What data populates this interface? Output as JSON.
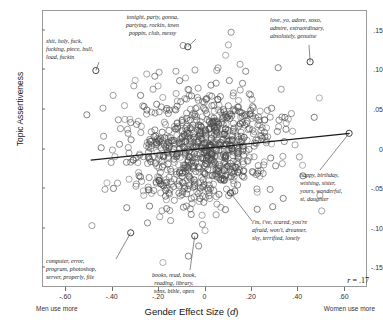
{
  "chart_data": {
    "type": "scatter",
    "title": "",
    "xlabel": "Gender Effect Size (d)",
    "ylabel": "Topic Assertiveness",
    "xlim": [
      -0.7,
      0.7
    ],
    "ylim": [
      -0.175,
      0.175
    ],
    "xticks": [
      -0.6,
      -0.4,
      -0.2,
      0,
      0.2,
      0.4,
      0.6
    ],
    "xticklabels": [
      "-.60",
      "-.40",
      "-.20",
      "0",
      ".20",
      ".40",
      ".60"
    ],
    "yticks": [
      0.15,
      0.1,
      0.05,
      0,
      -0.05,
      -0.1,
      -0.15
    ],
    "yticklabels": [
      ".15",
      ".10",
      ".05",
      "0",
      "-.05",
      "-.10",
      "-.15"
    ],
    "grid": false,
    "legend": null,
    "axis_end_labels": {
      "left": "Men use more",
      "right": "Women use more"
    },
    "correlation_label": "r = .17",
    "correlation": 0.17,
    "marker": {
      "shape": "open-circle",
      "size": 3.1,
      "stroke": "#4a4a4a",
      "fill": "none"
    },
    "n_points": 860,
    "fit_line": {
      "type": "linear",
      "color": "#1a1a1a",
      "x_start": -0.49,
      "y_start": -0.0148,
      "x_end": 0.625,
      "y_end": 0.0192
    },
    "annotations": [
      {
        "name": "profanity",
        "text": "shit, holy, fuck,\nfucking, piece, bull,\nload, fuckin",
        "point": {
          "x": -0.468,
          "y": 0.0985
        }
      },
      {
        "name": "partying",
        "text": "tonight, party, gonna,\npartying, rockin, town\npoppin, club, messy",
        "point": {
          "x": -0.072,
          "y": 0.1285
        }
      },
      {
        "name": "love",
        "text": "love, yo, adore, xoxo,\nadmire, extraordinary,\nabsolutely, genuine",
        "point": {
          "x": 0.455,
          "y": 0.1095
        }
      },
      {
        "name": "birthday",
        "text": "happy, birthday,\nwishing, sister,\nyours, wonderful,\nst, daughter",
        "point": {
          "x": 0.623,
          "y": 0.0192
        }
      },
      {
        "name": "fear",
        "text": "i'm, i've, scared, you're\nafraid, won't, dreamer,\nshy, terrified, lonely",
        "point": {
          "x": 0.112,
          "y": -0.0562
        }
      },
      {
        "name": "computer",
        "text": "computer, error,\nprogram, photoshop,\nserver, properly, file",
        "point": {
          "x": -0.318,
          "y": -0.1065
        }
      },
      {
        "name": "books",
        "text": "books, read, book,\nreading, library,\nsons, bible, open",
        "point": {
          "x": -0.042,
          "y": -0.1105
        }
      }
    ]
  }
}
